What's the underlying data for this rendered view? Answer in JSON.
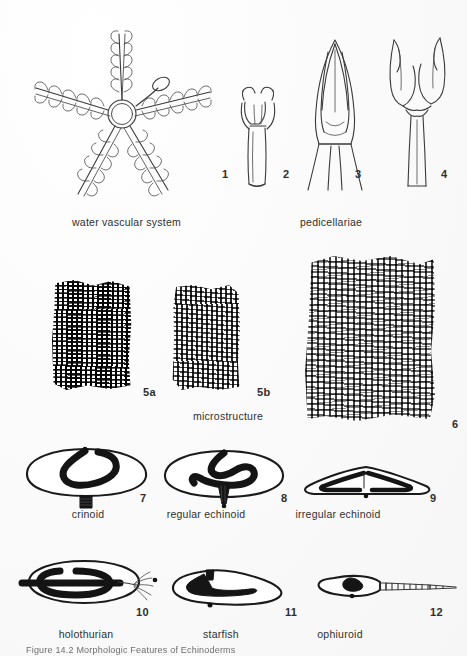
{
  "plate": {
    "caption": "Figure 14.2    Morphologic Features of Echinoderms",
    "background_color": "#fbfbfb",
    "ink_color": "#1a1a1a"
  },
  "rows": [
    {
      "row_name": "water-vascular-and-pedicellariae",
      "captions": [
        {
          "text": "water vascular system",
          "x": 72,
          "y": 216
        },
        {
          "text": "pedicellariae",
          "x": 300,
          "y": 216
        }
      ],
      "figures": [
        {
          "number": "1",
          "name": "water-vascular-system",
          "num_x": 222,
          "num_y": 174
        },
        {
          "number": "2",
          "name": "pedicellaria-stalked",
          "num_x": 283,
          "num_y": 174
        },
        {
          "number": "3",
          "name": "pedicellaria-closed-valves",
          "num_x": 355,
          "num_y": 174
        },
        {
          "number": "4",
          "name": "pedicellaria-open-jaws",
          "num_x": 441,
          "num_y": 174
        }
      ]
    },
    {
      "row_name": "stereom-microstructure",
      "captions": [
        {
          "text": "microstructure",
          "x": 193,
          "y": 412
        }
      ],
      "figures": [
        {
          "number": "5a",
          "name": "stereom-5a",
          "num_x": 143,
          "num_y": 392
        },
        {
          "number": "5b",
          "name": "stereom-5b",
          "num_x": 257,
          "num_y": 392
        },
        {
          "number": "6",
          "name": "stereom-6",
          "num_x": 452,
          "num_y": 424
        }
      ]
    },
    {
      "row_name": "body-plan-sections-upper",
      "captions": [
        {
          "text": "crinoid",
          "x": 82,
          "y": 512
        },
        {
          "text": "regular echinoid",
          "x": 203,
          "y": 512
        },
        {
          "text": "irregular echinoid",
          "x": 335,
          "y": 512
        }
      ],
      "figures": [
        {
          "number": "7",
          "name": "crinoid-section",
          "num_x": 140,
          "num_y": 498
        },
        {
          "number": "8",
          "name": "regular-echinoid-section",
          "num_x": 281,
          "num_y": 498
        },
        {
          "number": "9",
          "name": "irregular-echinoid-section",
          "num_x": 430,
          "num_y": 498
        }
      ]
    },
    {
      "row_name": "body-plan-sections-lower",
      "captions": [
        {
          "text": "holothurian",
          "x": 73,
          "y": 632
        },
        {
          "text": "starfish",
          "x": 210,
          "y": 632
        },
        {
          "text": "ophiuroid",
          "x": 330,
          "y": 632
        }
      ],
      "figures": [
        {
          "number": "10",
          "name": "holothurian-section",
          "num_x": 136,
          "num_y": 612
        },
        {
          "number": "11",
          "name": "starfish-section",
          "num_x": 285,
          "num_y": 612
        },
        {
          "number": "12",
          "name": "ophiuroid-section",
          "num_x": 430,
          "num_y": 612
        }
      ]
    }
  ]
}
